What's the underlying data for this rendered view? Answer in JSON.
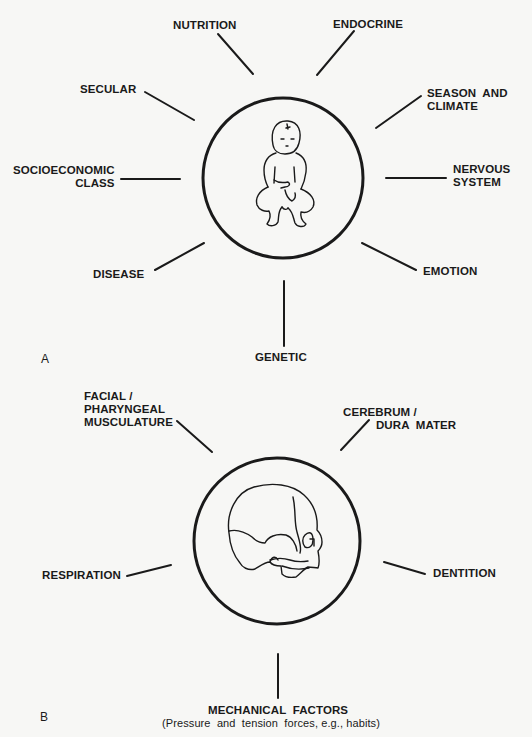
{
  "panel_a": {
    "letter": "A",
    "center_figure": "infant",
    "factors": {
      "nutrition": "NUTRITION",
      "endocrine": "ENDOCRINE",
      "secular": "SECULAR",
      "season_climate": "SEASON  AND\nCLIMATE",
      "socioeconomic_class": "SOCIOECONOMIC\nCLASS",
      "nervous_system": "NERVOUS\nSYSTEM",
      "disease": "DISEASE",
      "emotion": "EMOTION",
      "genetic": "GENETIC"
    }
  },
  "panel_b": {
    "letter": "B",
    "center_figure": "infant-skull",
    "factors": {
      "facial_pharyngeal": "FACIAL /\nPHARYNGEAL\nMUSCULATURE",
      "cerebrum_dura": "CEREBRUM /\n          DURA  MATER",
      "respiration": "RESPIRATION",
      "dentition": "DENTITION",
      "mechanical_factors": "MECHANICAL  FACTORS",
      "mechanical_factors_note": "(Pressure  and  tension  forces, e.g., habits)"
    }
  }
}
